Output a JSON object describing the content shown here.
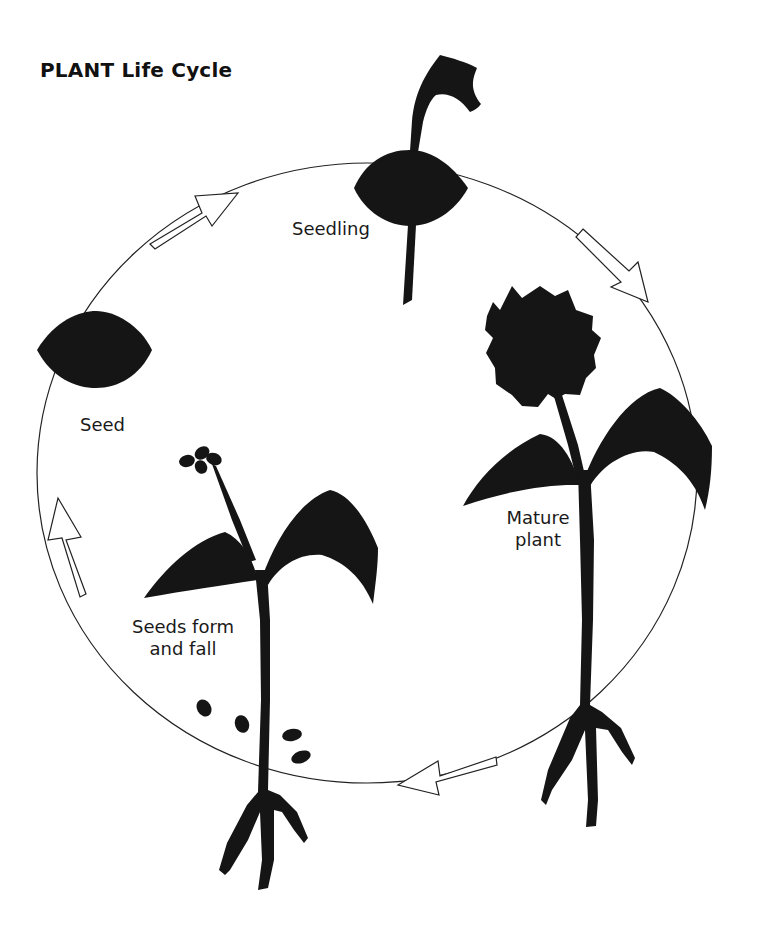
{
  "title": "PLANT Life Cycle",
  "stages": [
    {
      "id": "seed",
      "label": "Seed"
    },
    {
      "id": "seedling",
      "label": "Seedling"
    },
    {
      "id": "mature",
      "label_line1": "Mature",
      "label_line2": "plant"
    },
    {
      "id": "seeds-form",
      "label_line1": "Seeds form",
      "label_line2": "and fall"
    }
  ],
  "arrows": [
    {
      "from": "seed",
      "to": "seedling",
      "direction": "clockwise"
    },
    {
      "from": "seedling",
      "to": "mature",
      "direction": "clockwise"
    },
    {
      "from": "mature",
      "to": "seeds-form",
      "direction": "clockwise"
    },
    {
      "from": "seeds-form",
      "to": "seed",
      "direction": "clockwise"
    }
  ],
  "colors": {
    "ink": "#151515",
    "line": "#222222",
    "background": "#ffffff"
  }
}
